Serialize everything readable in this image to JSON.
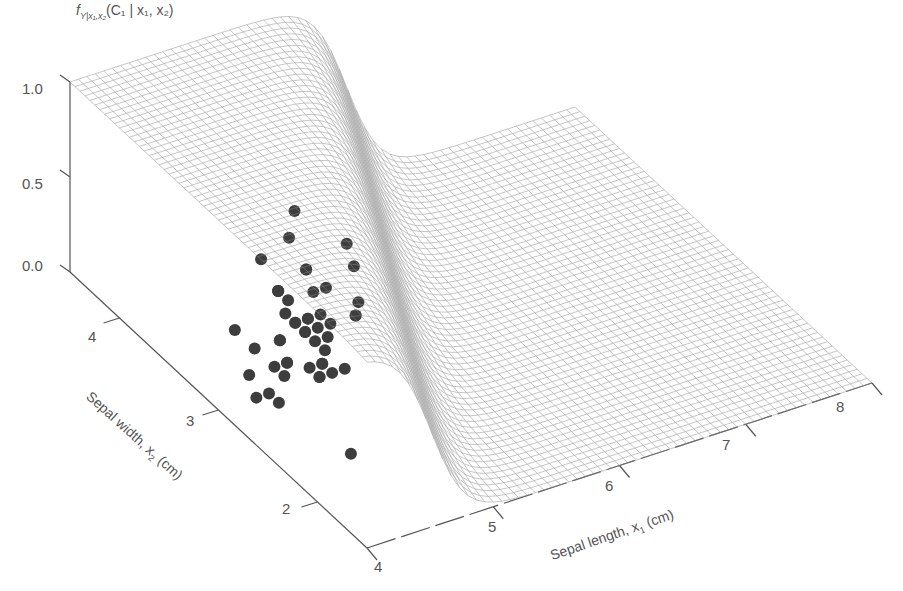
{
  "chart_data": {
    "type": "surface3d",
    "title": "",
    "zlabel": "f_{Y|x1,x2}(C1 | x1, x2)",
    "xlabel": "Sepal length, x1 (cm)",
    "ylabel": "Sepal width, x2 (cm)",
    "xlim": [
      4,
      8
    ],
    "ylim": [
      1.5,
      4.5
    ],
    "zlim": [
      0,
      1
    ],
    "x_ticks": [
      4,
      5,
      6,
      7,
      8
    ],
    "y_ticks": [
      2,
      3,
      4
    ],
    "z_ticks": [
      0.0,
      0.5,
      1.0
    ],
    "z_tick_labels": [
      "0.0",
      "0.5",
      "1.0"
    ],
    "x_tick_labels": [
      "4",
      "5",
      "6",
      "7",
      "8"
    ],
    "y_tick_labels": [
      "2",
      "3",
      "4"
    ],
    "surface": {
      "description": "Posterior probability of class C1 (logistic-like step): ~1 for small sepal length / large sepal width, dropping to ~0 beyond sepal length ~5.5",
      "style": "wireframe mesh, light gray",
      "grid_lines": 60
    },
    "scatter": {
      "series": "Class C1 samples (projected on z=0 plane)",
      "marker_color": "#3a3a3a",
      "points": [
        [
          5.1,
          3.5
        ],
        [
          4.9,
          3.0
        ],
        [
          4.7,
          3.2
        ],
        [
          4.6,
          3.1
        ],
        [
          5.0,
          3.6
        ],
        [
          5.4,
          3.9
        ],
        [
          4.6,
          3.4
        ],
        [
          5.0,
          3.4
        ],
        [
          4.4,
          2.9
        ],
        [
          4.9,
          3.1
        ],
        [
          5.4,
          3.7
        ],
        [
          4.8,
          3.4
        ],
        [
          4.8,
          3.0
        ],
        [
          4.3,
          3.0
        ],
        [
          5.8,
          4.0
        ],
        [
          5.7,
          4.4
        ],
        [
          5.4,
          3.9
        ],
        [
          5.1,
          3.5
        ],
        [
          5.7,
          3.8
        ],
        [
          5.1,
          3.8
        ],
        [
          5.4,
          3.4
        ],
        [
          5.1,
          3.7
        ],
        [
          4.6,
          3.6
        ],
        [
          5.1,
          3.3
        ],
        [
          4.8,
          3.4
        ],
        [
          5.0,
          3.0
        ],
        [
          5.0,
          3.4
        ],
        [
          5.2,
          3.5
        ],
        [
          5.2,
          3.4
        ],
        [
          4.7,
          3.2
        ],
        [
          4.8,
          3.1
        ],
        [
          5.4,
          3.4
        ],
        [
          5.2,
          4.1
        ],
        [
          5.5,
          4.2
        ],
        [
          4.9,
          3.1
        ],
        [
          5.0,
          3.2
        ],
        [
          5.5,
          3.5
        ],
        [
          4.4,
          3.0
        ],
        [
          5.1,
          3.4
        ],
        [
          5.0,
          3.5
        ],
        [
          4.5,
          2.3
        ],
        [
          4.4,
          3.2
        ],
        [
          5.0,
          3.5
        ],
        [
          5.1,
          3.8
        ],
        [
          4.8,
          3.0
        ],
        [
          5.1,
          3.8
        ],
        [
          4.6,
          3.2
        ],
        [
          5.3,
          3.7
        ],
        [
          5.0,
          3.3
        ]
      ]
    }
  },
  "labels": {
    "z_axis_title": "f",
    "z_axis_sub": "Y|x₁,x₂",
    "z_axis_rest": "(C₁ | x₁, x₂)",
    "x_axis_title": "Sepal length, x",
    "x_axis_sub": "1",
    "x_axis_unit": " (cm)",
    "y_axis_title": "Sepal width, x",
    "y_axis_sub": "2",
    "y_axis_unit": " (cm)"
  },
  "colors": {
    "mesh": "#8a8a8a",
    "axis": "#555555",
    "marker": "#3d3d3d"
  }
}
